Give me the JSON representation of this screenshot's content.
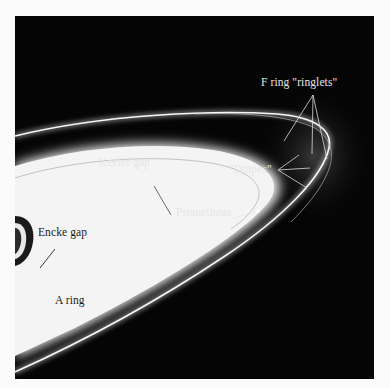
{
  "figure": {
    "labels": {
      "f_ring_ringlets": "F ring \"ringlets\"",
      "drapes": "\"Drapes\"",
      "keeler_gap": "Keeler gap",
      "prometheus": "Prometheus",
      "encke_gap": "Encke gap",
      "a_ring": "A ring"
    },
    "colors": {
      "space": "#050505",
      "ring": "#f2f2f2",
      "page": "#fbfbfb",
      "label_light": "#e6e6e6",
      "label_dark": "#1a1a1a"
    }
  }
}
